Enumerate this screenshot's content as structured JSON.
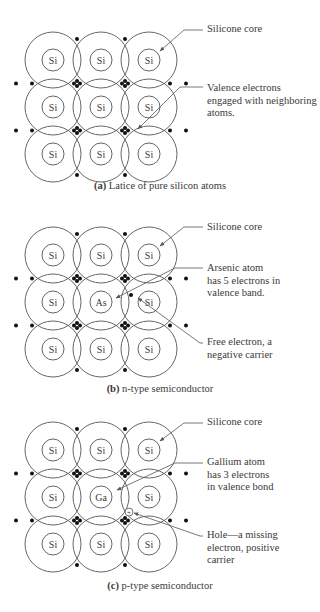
{
  "figure": {
    "panels": [
      {
        "id": "a",
        "caption_letter": "(a)",
        "caption_text": "Latice of pure silicon atoms",
        "grid": [
          [
            "Si",
            "Si",
            "Si"
          ],
          [
            "Si",
            "Si",
            "Si"
          ],
          [
            "Si",
            "Si",
            "Si"
          ]
        ],
        "labels": [
          {
            "lines": [
              "Silicone core"
            ]
          },
          {
            "lines": [
              "Valence electrons",
              "engaged with neighboring",
              "atoms."
            ]
          }
        ]
      },
      {
        "id": "b",
        "caption_letter": "(b)",
        "caption_text": "n-type semiconductor",
        "grid": [
          [
            "Si",
            "Si",
            "Si"
          ],
          [
            "Si",
            "As",
            "Si"
          ],
          [
            "Si",
            "Si",
            "Si"
          ]
        ],
        "labels": [
          {
            "lines": [
              "Silicone core"
            ]
          },
          {
            "lines": [
              "Arsenic atom",
              "has 5 electrons in",
              "valence band."
            ]
          },
          {
            "lines": [
              "Free electron, a",
              "negative carrier"
            ]
          }
        ]
      },
      {
        "id": "c",
        "caption_letter": "(c)",
        "caption_text": "p-type semiconductor",
        "grid": [
          [
            "Si",
            "Si",
            "Si"
          ],
          [
            "Si",
            "Ga",
            "Si"
          ],
          [
            "Si",
            "Si",
            "Si"
          ]
        ],
        "hole_symbol": "+",
        "labels": [
          {
            "lines": [
              "Silicone core"
            ]
          },
          {
            "lines": [
              "Gallium atom",
              "has 3 electrons",
              "in valence bond"
            ]
          },
          {
            "lines": [
              "Hole—a missing",
              "electron, positive",
              "carrier"
            ]
          }
        ]
      }
    ],
    "colors": {
      "line": "#555555",
      "dot": "#111111",
      "text": "#3a3a3a"
    }
  }
}
